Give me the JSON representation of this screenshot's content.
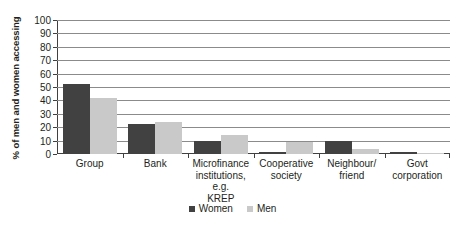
{
  "chart_data": {
    "type": "bar",
    "title": "",
    "xlabel": "",
    "ylabel": "% of men and women accessing",
    "ylim": [
      0,
      100
    ],
    "ytick_step": 10,
    "yticks": [
      100,
      90,
      80,
      70,
      60,
      50,
      40,
      30,
      20,
      10,
      0
    ],
    "grid": true,
    "legend_position": "bottom-center",
    "categories": [
      "Group",
      "Bank",
      "Microfinance institutions, e.g. KREP",
      "Cooperative society",
      "Neighbour/ friend",
      "Govt corporation"
    ],
    "category_lines": [
      [
        "Group"
      ],
      [
        "Bank"
      ],
      [
        "Microfinance",
        "institutions, e.g.",
        "KREP"
      ],
      [
        "Cooperative",
        "society"
      ],
      [
        "Neighbour/",
        "friend"
      ],
      [
        "Govt",
        "corporation"
      ]
    ],
    "series": [
      {
        "name": "Women",
        "color": "#414141",
        "values": [
          52.5,
          22.5,
          10,
          1.3,
          9.5,
          1.3
        ]
      },
      {
        "name": "Men",
        "color": "#c9c9c9",
        "values": [
          42,
          24,
          14.5,
          9.3,
          4,
          1
        ]
      }
    ]
  },
  "legend": {
    "items": [
      {
        "label": "Women",
        "swatch": "legend-swatch-women"
      },
      {
        "label": "Men",
        "swatch": "legend-swatch-men"
      }
    ]
  }
}
